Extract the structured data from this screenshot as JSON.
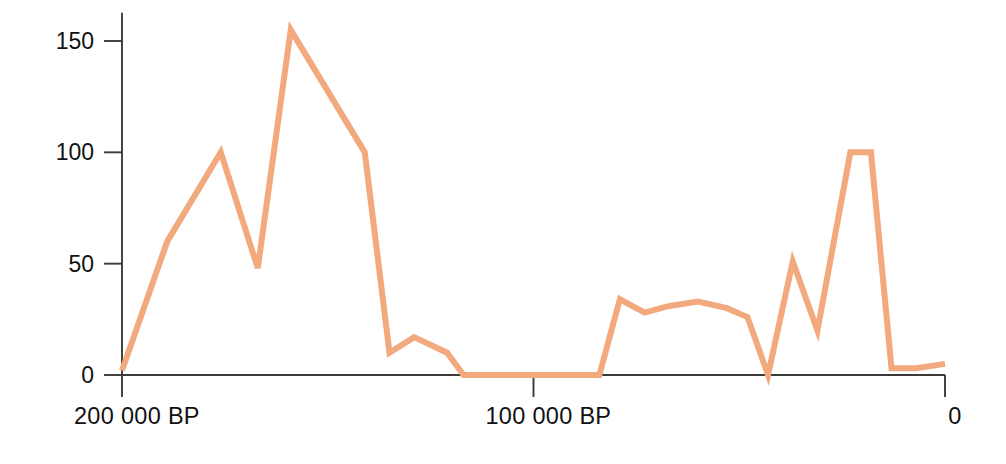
{
  "chart_data": {
    "type": "line",
    "title": "",
    "subtitle": "",
    "xlabel": "",
    "ylabel": "",
    "xlim": [
      200000,
      0
    ],
    "ylim": [
      0,
      160
    ],
    "x_tick_labels": [
      "200 000 BP",
      "100 000 BP",
      "0"
    ],
    "x_tick_values": [
      200000,
      100000,
      0
    ],
    "y_tick_labels": [
      "0",
      "50",
      "100",
      "150"
    ],
    "y_tick_values": [
      0,
      50,
      100,
      150
    ],
    "grid": false,
    "legend": "none",
    "x_axis_reversed": true,
    "series": [
      {
        "name": "frequency",
        "color": "#f2a97e",
        "line_width": 6,
        "x": [
          200000,
          189000,
          176000,
          167000,
          159000,
          141000,
          135000,
          129000,
          121000,
          117000,
          110000,
          103000,
          97000,
          90000,
          84000,
          79000,
          73000,
          67000,
          60000,
          53000,
          48000,
          43000,
          37000,
          31000,
          23000,
          18000,
          13000,
          7000,
          0
        ],
        "values": [
          2,
          60,
          100,
          48,
          155,
          100,
          10,
          17,
          10,
          0,
          0,
          0,
          0,
          0,
          0,
          34,
          28,
          31,
          33,
          30,
          26,
          0,
          51,
          20,
          100,
          100,
          3,
          3,
          5
        ]
      }
    ],
    "axis_color": "#3a3a3a",
    "background": "#ffffff"
  },
  "figure": {
    "accent_color": "#f2a97e",
    "axis_color": "#3a3a3a",
    "background_color": "#ffffff"
  }
}
